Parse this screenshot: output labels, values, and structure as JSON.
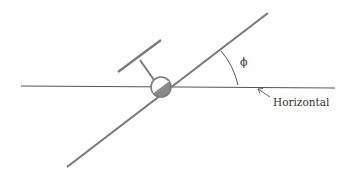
{
  "diagram": {
    "labels": {
      "angle_symbol": "ϕ",
      "horizontal": "Horizontal"
    },
    "colors": {
      "background": "#ffffff",
      "stroke": "#7a7a7a",
      "thin_line": "#555555",
      "fill_dark": "#8a8a8a",
      "text": "#333333"
    }
  }
}
